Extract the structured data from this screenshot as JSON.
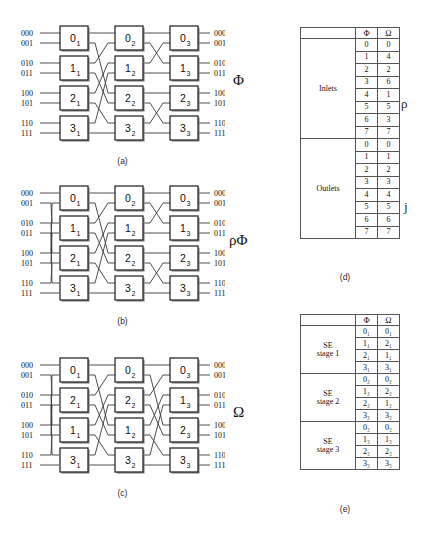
{
  "figure": {
    "captions": {
      "a": "(a)",
      "b": "(b)",
      "c": "(c)",
      "d": "(d)",
      "e": "(e)"
    }
  },
  "symbols": {
    "phi": "Φ",
    "omega": "Ω",
    "rho": "ρ",
    "rho_phi": "ρΦ",
    "j": "j"
  },
  "networks": {
    "a": {
      "name": "Phi network",
      "label": "Φ",
      "caption": "(a)",
      "input_terminals": [
        "000",
        "001",
        "010",
        "011",
        "100",
        "101",
        "110",
        "111"
      ],
      "output_terminals": [
        "000",
        "001",
        "010",
        "011",
        "100",
        "101",
        "110",
        "111"
      ],
      "stages": [
        {
          "index": 1,
          "switches": [
            "0₁",
            "1₁",
            "2₁",
            "3₁"
          ]
        },
        {
          "index": 2,
          "switches": [
            "0₂",
            "1₂",
            "2₂",
            "3₂"
          ]
        },
        {
          "index": 3,
          "switches": [
            "0₃",
            "1₃",
            "2₃",
            "3₃"
          ]
        }
      ],
      "input_permutation": "identity",
      "link_patterns": [
        "butterfly-4",
        "butterfly-2"
      ]
    },
    "b": {
      "name": "rho Phi network",
      "label": "ρΦ",
      "caption": "(b)",
      "input_terminals": [
        "000",
        "001",
        "010",
        "011",
        "100",
        "101",
        "110",
        "111"
      ],
      "output_terminals": [
        "000",
        "001",
        "010",
        "011",
        "100",
        "101",
        "110",
        "111"
      ],
      "stages": [
        {
          "index": 1,
          "switches": [
            "0₁",
            "1₁",
            "2₁",
            "3₁"
          ]
        },
        {
          "index": 2,
          "switches": [
            "0₂",
            "1₂",
            "2₂",
            "3₂"
          ]
        },
        {
          "index": 3,
          "switches": [
            "0₃",
            "1₃",
            "2₃",
            "3₃"
          ]
        }
      ],
      "input_permutation": "shuffle",
      "link_patterns": [
        "butterfly-4",
        "butterfly-2"
      ]
    },
    "c": {
      "name": "Omega network",
      "label": "Ω",
      "caption": "(c)",
      "input_terminals": [
        "000",
        "001",
        "010",
        "011",
        "100",
        "101",
        "110",
        "111"
      ],
      "output_terminals": [
        "000",
        "001",
        "010",
        "011",
        "100",
        "101",
        "110",
        "111"
      ],
      "stages": [
        {
          "index": 1,
          "switches": [
            "0₁",
            "2₁",
            "1₁",
            "3₁"
          ]
        },
        {
          "index": 2,
          "switches": [
            "0₂",
            "2₂",
            "1₂",
            "3₂"
          ]
        },
        {
          "index": 3,
          "switches": [
            "0₃",
            "1₃",
            "2₃",
            "3₃"
          ]
        }
      ],
      "input_permutation": "shuffle",
      "link_patterns": [
        "shuffle",
        "shuffle"
      ]
    }
  },
  "table_d": {
    "caption": "(d)",
    "columns": [
      "Φ",
      "Ω"
    ],
    "side_labels": {
      "inlets": "ρ",
      "outlets": "j"
    },
    "sections": [
      {
        "label": "Inlets",
        "side_label": "ρ",
        "rows": [
          [
            "0",
            "0"
          ],
          [
            "1",
            "4"
          ],
          [
            "2",
            "2"
          ],
          [
            "3",
            "6"
          ],
          [
            "4",
            "1"
          ],
          [
            "5",
            "5"
          ],
          [
            "6",
            "3"
          ],
          [
            "7",
            "7"
          ]
        ]
      },
      {
        "label": "Outlets",
        "side_label": "j",
        "rows": [
          [
            "0",
            "0"
          ],
          [
            "1",
            "1"
          ],
          [
            "2",
            "2"
          ],
          [
            "3",
            "3"
          ],
          [
            "4",
            "4"
          ],
          [
            "5",
            "5"
          ],
          [
            "6",
            "6"
          ],
          [
            "7",
            "7"
          ]
        ]
      }
    ]
  },
  "table_e": {
    "caption": "(e)",
    "columns": [
      "Φ",
      "Ω"
    ],
    "sections": [
      {
        "label_line1": "SE",
        "label_line2": "stage  1",
        "rows": [
          [
            "0₁",
            "0₁"
          ],
          [
            "1₁",
            "2₁"
          ],
          [
            "2₁",
            "1₁"
          ],
          [
            "3₁",
            "3₁"
          ]
        ]
      },
      {
        "label_line1": "SE",
        "label_line2": "stage  2",
        "rows": [
          [
            "0₂",
            "0₂"
          ],
          [
            "1₂",
            "2₂"
          ],
          [
            "2₂",
            "1₂"
          ],
          [
            "3₂",
            "3₂"
          ]
        ]
      },
      {
        "label_line1": "SE",
        "label_line2": "stage  3",
        "rows": [
          [
            "0₃",
            "0₃"
          ],
          [
            "1₃",
            "1₃"
          ],
          [
            "2₃",
            "2₃"
          ],
          [
            "3₃",
            "3₃"
          ]
        ]
      }
    ]
  },
  "colors": {
    "line": "#3a3a3a",
    "box_border": "#2b2b2b",
    "box_fill": "#ffffff",
    "table_border": "#555555",
    "text": "#111111"
  }
}
